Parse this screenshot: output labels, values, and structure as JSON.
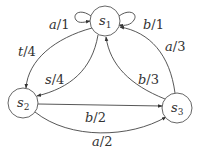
{
  "diagram": {
    "type": "finite-state-machine",
    "states": [
      {
        "id": "s1",
        "name": "s",
        "sub": "1"
      },
      {
        "id": "s2",
        "name": "s",
        "sub": "2"
      },
      {
        "id": "s3",
        "name": "s",
        "sub": "3"
      }
    ],
    "transitions": [
      {
        "from": "s1",
        "to": "s1",
        "label": "a/1"
      },
      {
        "from": "s1",
        "to": "s1",
        "label": "b/1"
      },
      {
        "from": "s1",
        "to": "s2",
        "label": "t/4"
      },
      {
        "from": "s1",
        "to": "s2",
        "label": "s/4"
      },
      {
        "from": "s2",
        "to": "s3",
        "label": "b/2"
      },
      {
        "from": "s2",
        "to": "s3",
        "label": "a/2"
      },
      {
        "from": "s3",
        "to": "s1",
        "label": "b/3"
      },
      {
        "from": "s3",
        "to": "s1",
        "label": "a/3"
      }
    ]
  },
  "labels": {
    "s1": {
      "name": "s",
      "sub": "1"
    },
    "s2": {
      "name": "s",
      "sub": "2"
    },
    "s3": {
      "name": "s",
      "sub": "3"
    },
    "a1": {
      "letter": "a",
      "rest": "/1"
    },
    "b1": {
      "letter": "b",
      "rest": "/1"
    },
    "t4": {
      "letter": "t",
      "rest": "/4"
    },
    "s4": {
      "letter": "s",
      "rest": "/4"
    },
    "b2": {
      "letter": "b",
      "rest": "/2"
    },
    "a2": {
      "letter": "a",
      "rest": "/2"
    },
    "b3": {
      "letter": "b",
      "rest": "/3"
    },
    "a3": {
      "letter": "a",
      "rest": "/3"
    }
  }
}
